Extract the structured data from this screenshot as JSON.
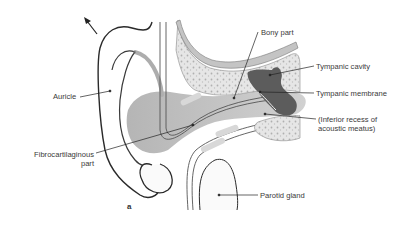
{
  "figure": {
    "panel_letter": "a",
    "labels": {
      "auricle": "Auricle",
      "fibrocartilaginous_line1": "Fibrocartilaginous",
      "fibrocartilaginous_line2": "part",
      "bony_part": "Bony part",
      "tympanic_cavity": "Tympanic cavity",
      "tympanic_membrane": "Tympanic membrane",
      "inferior_recess_line1": "(Inferior recess of",
      "inferior_recess_line2": "acoustic meatus)",
      "parotid_gland": "Parotid gland"
    },
    "colors": {
      "outline": "#2a2a2a",
      "canal_fill": "#b9b9b9",
      "bone_fill": "#e2e2e2",
      "cavity_fill": "#5a5a5a",
      "soft_tissue": "#c8c8c8"
    }
  }
}
